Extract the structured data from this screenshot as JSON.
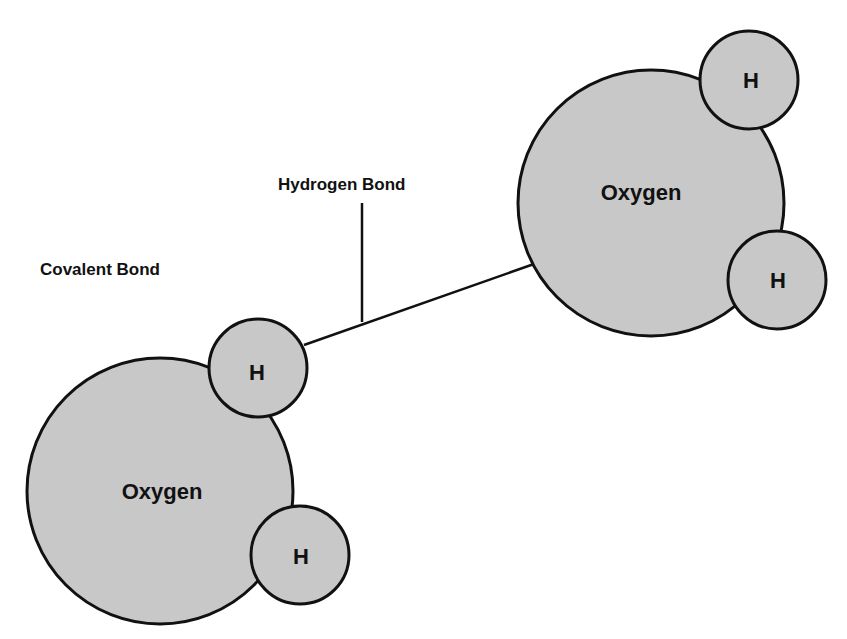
{
  "diagram": {
    "colors": {
      "atom_fill": "#c9c9c9",
      "outline": "#111111",
      "background": "#ffffff"
    },
    "labels": {
      "hydrogen_bond": "Hydrogen Bond",
      "covalent_bond": "Covalent Bond"
    },
    "molecules": [
      {
        "name": "water-molecule-left",
        "oxygen": {
          "label": "Oxygen",
          "cx": 160,
          "cy": 491,
          "r": 133
        },
        "hydrogens": [
          {
            "label": "H",
            "cx": 258,
            "cy": 368,
            "r": 49
          },
          {
            "label": "H",
            "cx": 300,
            "cy": 555,
            "r": 49
          }
        ]
      },
      {
        "name": "water-molecule-right",
        "oxygen": {
          "label": "Oxygen",
          "cx": 651,
          "cy": 203,
          "r": 133
        },
        "hydrogens": [
          {
            "label": "H",
            "cx": 749,
            "cy": 80,
            "r": 49
          },
          {
            "label": "H",
            "cx": 777,
            "cy": 280,
            "r": 49
          }
        ]
      }
    ]
  }
}
